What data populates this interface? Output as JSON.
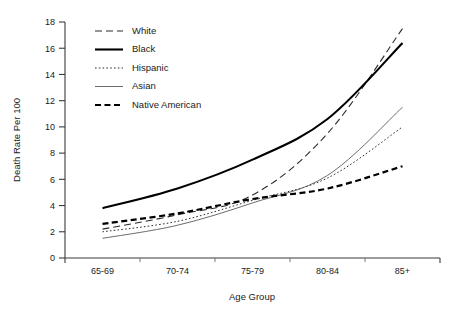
{
  "chart_data": {
    "type": "line",
    "title": "",
    "xlabel": "Age Group",
    "ylabel": "Death Rate Per 100",
    "categories": [
      "65-69",
      "70-74",
      "75-79",
      "80-84",
      "85+"
    ],
    "ylim": [
      0,
      18
    ],
    "yticks": [
      0,
      2,
      4,
      6,
      8,
      10,
      12,
      14,
      16,
      18
    ],
    "ytick_labels": [
      "0",
      "2",
      "4",
      "6",
      "8",
      "10",
      "12",
      "14",
      "16",
      "18"
    ],
    "grid": false,
    "legend_position": "top-left-inside",
    "series": [
      {
        "name": "White",
        "values": [
          2.2,
          3.3,
          4.8,
          9.5,
          17.5
        ],
        "color": "#2b2b2b",
        "style": "long-dash",
        "width": 1.1,
        "dasharray": "7,4"
      },
      {
        "name": "Black",
        "values": [
          3.8,
          5.3,
          7.5,
          10.6,
          16.4
        ],
        "color": "#000000",
        "style": "solid-thick",
        "width": 2.1,
        "dasharray": "none"
      },
      {
        "name": "Hispanic",
        "values": [
          2.0,
          2.8,
          4.4,
          6.1,
          10.0
        ],
        "color": "#2b2b2b",
        "style": "dotted",
        "width": 1.0,
        "dasharray": "1.6,2.2"
      },
      {
        "name": "Asian",
        "values": [
          1.5,
          2.5,
          4.2,
          6.3,
          11.5
        ],
        "color": "#5a5a5a",
        "style": "solid-thin",
        "width": 0.9,
        "dasharray": "none"
      },
      {
        "name": "Native American",
        "values": [
          2.6,
          3.4,
          4.5,
          5.3,
          7.0
        ],
        "color": "#000000",
        "style": "thick-dash",
        "width": 2.2,
        "dasharray": "6,3.5"
      }
    ]
  },
  "legend": {
    "entries": [
      {
        "label": "White"
      },
      {
        "label": "Black"
      },
      {
        "label": "Hispanic"
      },
      {
        "label": "Asian"
      },
      {
        "label": "Native American"
      }
    ]
  },
  "axes": {
    "y_title": "Death Rate Per 100",
    "x_title": "Age Group"
  }
}
